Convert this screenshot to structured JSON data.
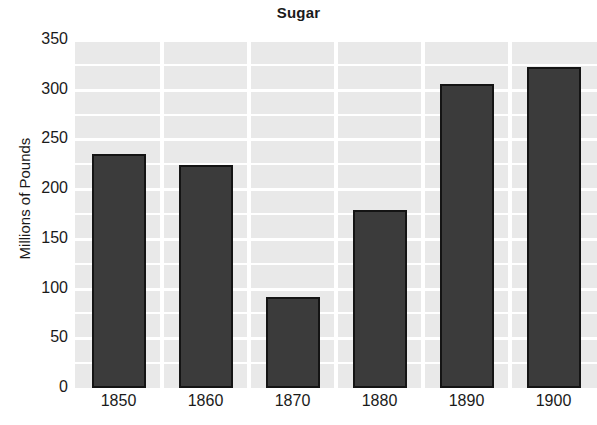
{
  "chart_data": {
    "type": "bar",
    "title": "Sugar",
    "xlabel": "",
    "ylabel": "Millions of Pounds",
    "categories": [
      "1850",
      "1860",
      "1870",
      "1880",
      "1890",
      "1900"
    ],
    "values": [
      235,
      224,
      92,
      179,
      306,
      323
    ],
    "ylim": [
      0,
      350
    ],
    "yticks": [
      0,
      50,
      100,
      150,
      200,
      250,
      300,
      350
    ],
    "ytick_labels": [
      "0",
      "50",
      "100",
      "150",
      "200",
      "250",
      "300",
      "350"
    ],
    "minor_gridline_step": 25,
    "grid": true,
    "legend": false,
    "bar_fill_color": "#3b3b3b",
    "bar_edge_color": "#141414",
    "plot_background_color": "#e9e9e9",
    "gridline_color": "#ffffff",
    "figure_background_color": "#ffffff",
    "text_color": "#1a1a1a"
  }
}
